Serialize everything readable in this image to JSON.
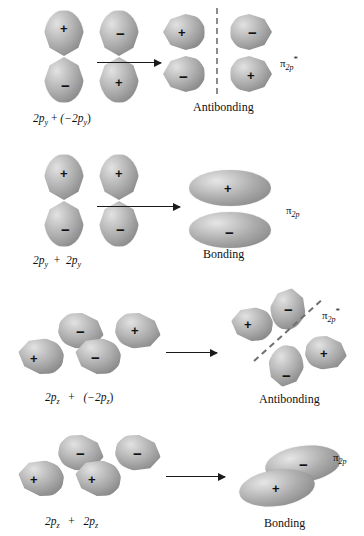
{
  "figure": {
    "colors": {
      "orbital_light": "#e2e2e2",
      "orbital_mid": "#a8a8a8",
      "orbital_dark": "#7d7d7d",
      "nodal_line": "#8c8c8c",
      "ink": "#1a1a1a",
      "background": "#ffffff"
    },
    "signs": {
      "positive": "+",
      "negative": "−"
    }
  },
  "rows": [
    {
      "id": "row-1",
      "equation_parts": {
        "left": "2p",
        "left_sub": "y",
        "operator": "+",
        "right": "(−2p",
        "right_sub": "y",
        "right_tail": ")"
      },
      "equation_text": "2p_y + (−2p_y)",
      "result_caption": "Antibonding",
      "mo_label": {
        "symbol": "π",
        "subscript": "2p",
        "superscript": "*"
      },
      "mo_label_text": "π₂ₚ*",
      "nodal_plane": "vertical-dashed",
      "left_orbitals": [
        {
          "name": "atomic-orbital-2py-a",
          "lobes": [
            {
              "sign": "+",
              "position": "top"
            },
            {
              "sign": "−",
              "position": "bottom"
            }
          ]
        },
        {
          "name": "atomic-orbital-2py-b",
          "lobes": [
            {
              "sign": "−",
              "position": "top"
            },
            {
              "sign": "+",
              "position": "bottom"
            }
          ]
        }
      ],
      "result_orbitals": [
        {
          "name": "mo-lobe-upper-left",
          "sign": "+"
        },
        {
          "name": "mo-lobe-lower-left",
          "sign": "−"
        },
        {
          "name": "mo-lobe-upper-right",
          "sign": "−"
        },
        {
          "name": "mo-lobe-lower-right",
          "sign": "+"
        }
      ]
    },
    {
      "id": "row-2",
      "equation_parts": {
        "left": "2p",
        "left_sub": "y",
        "operator": "+",
        "right": "2p",
        "right_sub": "y",
        "right_tail": ""
      },
      "equation_text": "2p_y + 2p_y",
      "result_caption": "Bonding",
      "mo_label": {
        "symbol": "π",
        "subscript": "2p",
        "superscript": ""
      },
      "mo_label_text": "π₂ₚ",
      "nodal_plane": "none",
      "left_orbitals": [
        {
          "name": "atomic-orbital-2py-a",
          "lobes": [
            {
              "sign": "+",
              "position": "top"
            },
            {
              "sign": "−",
              "position": "bottom"
            }
          ]
        },
        {
          "name": "atomic-orbital-2py-b",
          "lobes": [
            {
              "sign": "+",
              "position": "top"
            },
            {
              "sign": "−",
              "position": "bottom"
            }
          ]
        }
      ],
      "result_orbitals": [
        {
          "name": "mo-ellipse-upper",
          "sign": "+"
        },
        {
          "name": "mo-ellipse-lower",
          "sign": "−"
        }
      ]
    },
    {
      "id": "row-3",
      "equation_parts": {
        "left": "2p",
        "left_sub": "z",
        "operator": "+",
        "right": "(−2p",
        "right_sub": "z",
        "right_tail": ")"
      },
      "equation_text": "2p_z + (−2p_z)",
      "result_caption": "Antibonding",
      "mo_label": {
        "symbol": "π",
        "subscript": "2p",
        "superscript": "*"
      },
      "mo_label_text": "π₂ₚ*",
      "nodal_plane": "diagonal-dashed",
      "left_orbitals": [
        {
          "name": "atomic-orbital-2pz-a",
          "lobes": [
            {
              "sign": "+",
              "position": "lower-left"
            },
            {
              "sign": "−",
              "position": "upper-right"
            }
          ]
        },
        {
          "name": "atomic-orbital-2pz-b",
          "lobes": [
            {
              "sign": "−",
              "position": "lower-left"
            },
            {
              "sign": "+",
              "position": "upper-right"
            }
          ]
        }
      ],
      "result_orbitals": [
        {
          "name": "mo-lobe-left",
          "sign": "+"
        },
        {
          "name": "mo-lobe-top",
          "sign": "−"
        },
        {
          "name": "mo-lobe-bottom",
          "sign": "−"
        },
        {
          "name": "mo-lobe-right",
          "sign": "+"
        }
      ]
    },
    {
      "id": "row-4",
      "equation_parts": {
        "left": "2p",
        "left_sub": "z",
        "operator": "+",
        "right": "2p",
        "right_sub": "z",
        "right_tail": ""
      },
      "equation_text": "2p_z + 2p_z",
      "result_caption": "Bonding",
      "mo_label": {
        "symbol": "π",
        "subscript": "2p",
        "superscript": ""
      },
      "mo_label_text": "π₂ₚ",
      "nodal_plane": "none",
      "left_orbitals": [
        {
          "name": "atomic-orbital-2pz-a",
          "lobes": [
            {
              "sign": "+",
              "position": "lower-left"
            },
            {
              "sign": "−",
              "position": "upper-right"
            }
          ]
        },
        {
          "name": "atomic-orbital-2pz-b",
          "lobes": [
            {
              "sign": "+",
              "position": "lower-left"
            },
            {
              "sign": "−",
              "position": "upper-right"
            }
          ]
        }
      ],
      "result_orbitals": [
        {
          "name": "mo-ellipse-upper",
          "sign": "−"
        },
        {
          "name": "mo-ellipse-lower",
          "sign": "+"
        }
      ]
    }
  ]
}
